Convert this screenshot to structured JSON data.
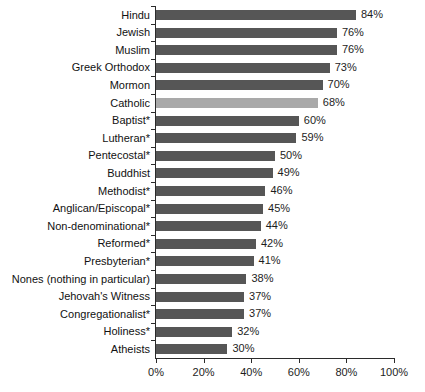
{
  "chart_data": {
    "type": "bar",
    "orientation": "horizontal",
    "title": "",
    "subtitle": "",
    "xlabel": "",
    "ylabel": "",
    "xlim": [
      0,
      100
    ],
    "grid": false,
    "legend": false,
    "value_suffix": "%",
    "colors": {
      "bar_default": "#565656",
      "bar_highlight": "#a9a9a9",
      "axis": "#2b2b2b",
      "text": "#111111",
      "background": "#ffffff"
    },
    "highlight_category": "Catholic",
    "categories": [
      "Hindu",
      "Jewish",
      "Muslim",
      "Greek Orthodox",
      "Mormon",
      "Catholic",
      "Baptist*",
      "Lutheran*",
      "Pentecostal*",
      "Buddhist",
      "Methodist*",
      "Anglican/Episcopal*",
      "Non-denominational*",
      "Reformed*",
      "Presbyterian*",
      "Nones (nothing in particular)",
      "Jehovah's Witness",
      "Congregationalist*",
      "Holiness*",
      "Atheists"
    ],
    "values": [
      84,
      76,
      76,
      73,
      70,
      68,
      60,
      59,
      50,
      49,
      46,
      45,
      44,
      42,
      41,
      38,
      37,
      37,
      32,
      30
    ],
    "value_labels": [
      "84%",
      "76%",
      "76%",
      "73%",
      "70%",
      "68%",
      "60%",
      "59%",
      "50%",
      "49%",
      "46%",
      "45%",
      "44%",
      "42%",
      "41%",
      "38%",
      "37%",
      "37%",
      "32%",
      "30%"
    ],
    "xticks": [
      0,
      20,
      40,
      60,
      80,
      100
    ],
    "xtick_labels": [
      "0%",
      "20%",
      "40%",
      "60%",
      "80%",
      "100%"
    ]
  }
}
